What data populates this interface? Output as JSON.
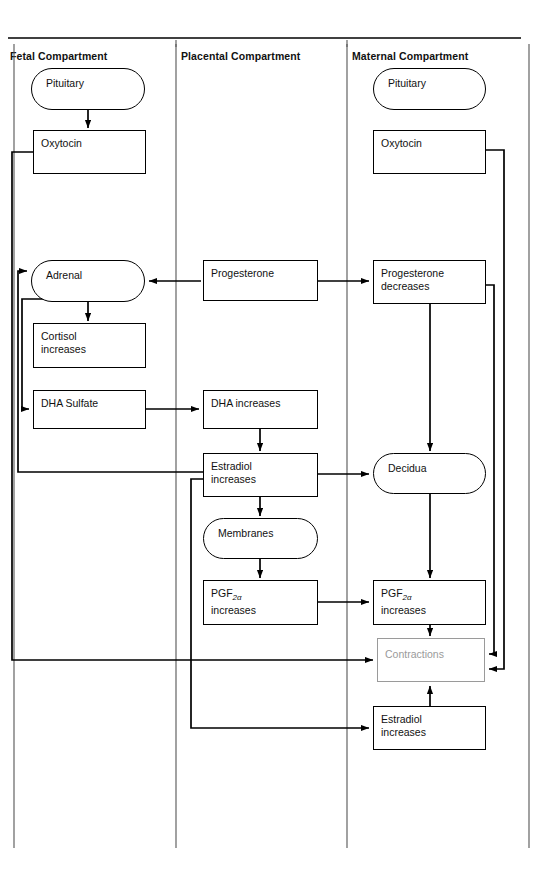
{
  "diagram": {
    "title_row": {
      "fetal": "Fetal Compartment",
      "placental": "Placental Compartment",
      "maternal": "Maternal Compartment"
    },
    "colors": {
      "stroke": "#000000",
      "ghost_stroke": "#9a9a9a",
      "ghost_text": "#9a9a9a",
      "divider": "#555555",
      "background": "#ffffff"
    },
    "nodes": [
      {
        "id": "fetal-pituitary",
        "label": "Pituitary",
        "shape": "rounded",
        "column": "fetal",
        "x": 31,
        "y": 68,
        "w": 114,
        "h": 42
      },
      {
        "id": "fetal-oxytocin",
        "label": "Oxytocin",
        "shape": "rectangle",
        "column": "fetal",
        "x": 33,
        "y": 130,
        "w": 113,
        "h": 44
      },
      {
        "id": "fetal-adrenal",
        "label": "Adrenal",
        "shape": "rounded",
        "column": "fetal",
        "x": 31,
        "y": 260,
        "w": 114,
        "h": 42
      },
      {
        "id": "fetal-cortisol",
        "label": "Cortisol increases",
        "line1": "Cortisol",
        "line2": "increases",
        "shape": "rectangle",
        "column": "fetal",
        "x": 33,
        "y": 323,
        "w": 113,
        "h": 45
      },
      {
        "id": "fetal-dha-sulfate",
        "label": "DHA Sulfate",
        "shape": "rectangle",
        "column": "fetal",
        "x": 33,
        "y": 390,
        "w": 113,
        "h": 39
      },
      {
        "id": "plac-progesterone",
        "label": "Progesterone",
        "shape": "rectangle",
        "column": "placental",
        "x": 203,
        "y": 260,
        "w": 115,
        "h": 41
      },
      {
        "id": "plac-dha-increases",
        "label": "DHA increases",
        "shape": "rectangle",
        "column": "placental",
        "x": 203,
        "y": 390,
        "w": 115,
        "h": 39
      },
      {
        "id": "plac-estradiol",
        "label": "Estradiol increases",
        "line1": "Estradiol",
        "line2": "increases",
        "shape": "rectangle",
        "column": "placental",
        "x": 203,
        "y": 453,
        "w": 115,
        "h": 44
      },
      {
        "id": "plac-membranes",
        "label": "Membranes",
        "shape": "rounded",
        "column": "placental",
        "x": 203,
        "y": 518,
        "w": 115,
        "h": 41
      },
      {
        "id": "plac-pgf2a",
        "label": "PGF2α increases",
        "line1": "PGF",
        "sub": "2α",
        "line2": "increases",
        "shape": "rectangle",
        "column": "placental",
        "x": 203,
        "y": 580,
        "w": 115,
        "h": 45
      },
      {
        "id": "mat-pituitary",
        "label": "Pituitary",
        "shape": "rounded",
        "column": "maternal",
        "x": 373,
        "y": 68,
        "w": 113,
        "h": 42
      },
      {
        "id": "mat-oxytocin",
        "label": "Oxytocin",
        "shape": "rectangle",
        "column": "maternal",
        "x": 373,
        "y": 130,
        "w": 113,
        "h": 44
      },
      {
        "id": "mat-progesterone-dec",
        "label": "Progesterone decreases",
        "line1": "Progesterone",
        "line2": "decreases",
        "shape": "rectangle",
        "column": "maternal",
        "x": 373,
        "y": 260,
        "w": 113,
        "h": 44
      },
      {
        "id": "mat-decidua",
        "label": "Decidua",
        "shape": "rounded",
        "column": "maternal",
        "x": 373,
        "y": 453,
        "w": 113,
        "h": 41
      },
      {
        "id": "mat-pgf2a",
        "label": "PGF2α increases",
        "line1": "PGF",
        "sub": "2α",
        "line2": "increases",
        "shape": "rectangle",
        "column": "maternal",
        "x": 373,
        "y": 580,
        "w": 113,
        "h": 45
      },
      {
        "id": "mat-contractions",
        "label": "Contractions",
        "shape": "rectangle-ghost",
        "column": "maternal",
        "x": 377,
        "y": 638,
        "w": 108,
        "h": 44
      },
      {
        "id": "mat-estradiol",
        "label": "Estradiol increases",
        "line1": "Estradiol",
        "line2": "increases",
        "shape": "rectangle",
        "column": "maternal",
        "x": 373,
        "y": 706,
        "w": 113,
        "h": 44
      }
    ],
    "edges": [
      {
        "from": "fetal-pituitary",
        "to": "fetal-oxytocin",
        "kind": "arrow-down"
      },
      {
        "from": "fetal-oxytocin",
        "to": "mat-contractions",
        "kind": "left-loop-long"
      },
      {
        "from": "plac-progesterone",
        "to": "fetal-adrenal",
        "kind": "arrow-left"
      },
      {
        "from": "plac-progesterone",
        "to": "mat-progesterone-dec",
        "kind": "arrow-right"
      },
      {
        "from": "fetal-adrenal",
        "to": "fetal-cortisol",
        "kind": "arrow-down"
      },
      {
        "from": "fetal-adrenal",
        "to": "fetal-dha-sulfate",
        "kind": "left-loop-short"
      },
      {
        "from": "fetal-dha-sulfate",
        "to": "plac-dha-increases",
        "kind": "arrow-right"
      },
      {
        "from": "plac-dha-increases",
        "to": "plac-estradiol",
        "kind": "arrow-down"
      },
      {
        "from": "plac-estradiol",
        "to": "fetal-adrenal",
        "kind": "left-loop-adrenal"
      },
      {
        "from": "plac-estradiol",
        "to": "mat-decidua",
        "kind": "arrow-right"
      },
      {
        "from": "plac-estradiol",
        "to": "plac-membranes",
        "kind": "arrow-down"
      },
      {
        "from": "plac-estradiol",
        "to": "mat-estradiol",
        "kind": "down-right-loop"
      },
      {
        "from": "plac-membranes",
        "to": "plac-pgf2a",
        "kind": "arrow-down"
      },
      {
        "from": "plac-pgf2a",
        "to": "mat-pgf2a",
        "kind": "arrow-right"
      },
      {
        "from": "mat-progesterone-dec",
        "to": "mat-decidua",
        "kind": "arrow-down"
      },
      {
        "from": "mat-progesterone-dec",
        "to": "mat-contractions",
        "kind": "right-loop-inner"
      },
      {
        "from": "mat-oxytocin",
        "to": "mat-contractions",
        "kind": "right-loop-outer"
      },
      {
        "from": "mat-decidua",
        "to": "mat-pgf2a",
        "kind": "arrow-down"
      },
      {
        "from": "mat-pgf2a",
        "to": "mat-contractions",
        "kind": "arrow-down"
      },
      {
        "from": "mat-estradiol",
        "to": "mat-contractions",
        "kind": "arrow-up"
      }
    ],
    "dividers": [
      {
        "id": "divider-left",
        "x": 14
      },
      {
        "id": "divider-fetal-placental",
        "x": 176
      },
      {
        "id": "divider-placental-maternal",
        "x": 347
      },
      {
        "id": "divider-right",
        "x": 529
      }
    ],
    "top_rule": {
      "x1": 8,
      "x2": 521,
      "y": 38
    }
  }
}
